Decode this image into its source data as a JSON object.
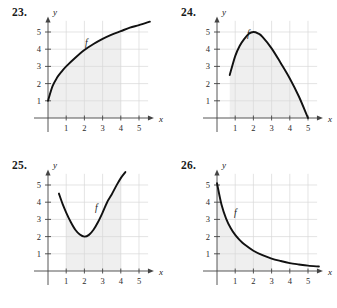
{
  "page": {
    "background": "#ffffff",
    "grid_color": "#d9d9d9",
    "shade_color": "#efefef",
    "curve_color": "#111111",
    "axis_color": "#444444"
  },
  "panels": [
    {
      "number": "23.",
      "name": "panel-23",
      "x_label": "x",
      "y_label": "y",
      "f_label": "f",
      "chart_data": {
        "type": "line",
        "title": "23.",
        "xlabel": "x",
        "ylabel": "y",
        "grid": true,
        "legend": "none",
        "annotations": [
          "f"
        ],
        "xlim": [
          0,
          5.6
        ],
        "ylim": [
          0,
          5.9
        ],
        "xticks": [
          1,
          2,
          3,
          4,
          5
        ],
        "yticks": [
          1,
          2,
          3,
          4,
          5
        ],
        "shaded_region": {
          "x_from": 0,
          "x_to": 4,
          "under_curve": true
        },
        "series": [
          {
            "name": "f",
            "description": "increasing concave-down curve from (0,1) rising to about (5.6,5.6)",
            "x": [
              0.0,
              0.25,
              0.5,
              0.75,
              1.0,
              1.5,
              2.0,
              2.5,
              3.0,
              3.5,
              4.0,
              4.5,
              5.0,
              5.6
            ],
            "y": [
              1.0,
              1.85,
              2.35,
              2.7,
              3.0,
              3.5,
              3.95,
              4.3,
              4.6,
              4.85,
              5.05,
              5.25,
              5.4,
              5.6
            ]
          }
        ]
      }
    },
    {
      "number": "24.",
      "name": "panel-24",
      "x_label": "x",
      "y_label": "y",
      "f_label": "f",
      "chart_data": {
        "type": "line",
        "title": "24.",
        "xlabel": "x",
        "ylabel": "y",
        "grid": true,
        "legend": "none",
        "annotations": [
          "f"
        ],
        "xlim": [
          0,
          5.6
        ],
        "ylim": [
          0,
          5.9
        ],
        "xticks": [
          1,
          2,
          3,
          4,
          5
        ],
        "yticks": [
          1,
          2,
          3,
          4,
          5
        ],
        "shaded_region": {
          "x_from": 0.7,
          "x_to": 5,
          "under_curve": true
        },
        "series": [
          {
            "name": "f",
            "description": "concave-down arch starting at (0.7,2.5), peaking at (2,5), falling to (5,0)",
            "x": [
              0.7,
              1.0,
              1.25,
              1.5,
              1.75,
              2.0,
              2.25,
              2.5,
              3.0,
              3.5,
              4.0,
              4.5,
              5.0
            ],
            "y": [
              2.5,
              3.6,
              4.2,
              4.6,
              4.9,
              5.0,
              4.92,
              4.72,
              4.05,
              3.2,
              2.3,
              1.25,
              0.0
            ]
          }
        ]
      }
    },
    {
      "number": "25.",
      "name": "panel-25",
      "x_label": "x",
      "y_label": "y",
      "f_label": "f",
      "chart_data": {
        "type": "line",
        "title": "25.",
        "xlabel": "x",
        "ylabel": "y",
        "grid": true,
        "legend": "none",
        "annotations": [
          "f"
        ],
        "xlim": [
          0,
          5.6
        ],
        "ylim": [
          0,
          5.9
        ],
        "xticks": [
          1,
          2,
          3,
          4,
          5
        ],
        "yticks": [
          1,
          2,
          3,
          4,
          5
        ],
        "shaded_region": {
          "x_from": 1,
          "x_to": 4,
          "under_curve": true
        },
        "series": [
          {
            "name": "f",
            "description": "upward parabola with vertex at (2,2), from (0.6,4.5) to (4.25,5.7)",
            "x": [
              0.6,
              0.8,
              1.0,
              1.25,
              1.5,
              1.75,
              2.0,
              2.25,
              2.5,
              2.75,
              3.0,
              3.25,
              3.5,
              3.75,
              4.0,
              4.25
            ],
            "y": [
              4.5,
              3.9,
              3.4,
              2.85,
              2.4,
              2.12,
              2.0,
              2.1,
              2.4,
              2.85,
              3.4,
              4.0,
              4.45,
              4.95,
              5.4,
              5.75
            ]
          }
        ]
      }
    },
    {
      "number": "26.",
      "name": "panel-26",
      "x_label": "x",
      "y_label": "y",
      "f_label": "f",
      "chart_data": {
        "type": "line",
        "title": "26.",
        "xlabel": "x",
        "ylabel": "y",
        "grid": true,
        "legend": "none",
        "annotations": [
          "f"
        ],
        "xlim": [
          0,
          5.6
        ],
        "ylim": [
          0,
          5.9
        ],
        "xticks": [
          1,
          2,
          3,
          4,
          5
        ],
        "yticks": [
          1,
          2,
          3,
          4,
          5
        ],
        "shaded_region": {
          "x_from": 0,
          "x_to": 3,
          "under_curve": true
        },
        "series": [
          {
            "name": "f",
            "description": "decaying exponential-like curve from (0,5.1) down toward (5.6,0.25)",
            "x": [
              0.0,
              0.25,
              0.5,
              0.75,
              1.0,
              1.25,
              1.5,
              2.0,
              2.5,
              3.0,
              3.5,
              4.0,
              4.5,
              5.0,
              5.6
            ],
            "y": [
              5.1,
              3.85,
              3.05,
              2.5,
              2.1,
              1.8,
              1.55,
              1.18,
              0.92,
              0.72,
              0.58,
              0.46,
              0.38,
              0.31,
              0.26
            ]
          }
        ]
      }
    }
  ]
}
